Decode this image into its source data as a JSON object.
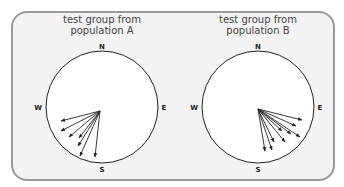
{
  "panels": [
    {
      "title_line1": "test group from",
      "title_line2": "population A",
      "compass": {
        "north": "N",
        "east": "E",
        "south": "S",
        "west": "W"
      },
      "arrow_count": 7,
      "arrow_direction": "south-west"
    },
    {
      "title_line1": "test group from",
      "title_line2": "population B",
      "compass": {
        "north": "N",
        "east": "E",
        "south": "S",
        "west": "W"
      },
      "arrow_count": 9,
      "arrow_direction": "south-east"
    }
  ],
  "colors": {
    "frame_border": "#9a9a9a",
    "frame_fill": "#f3f3f3",
    "circle_fill": "#ffffff",
    "stroke": "#222222"
  }
}
